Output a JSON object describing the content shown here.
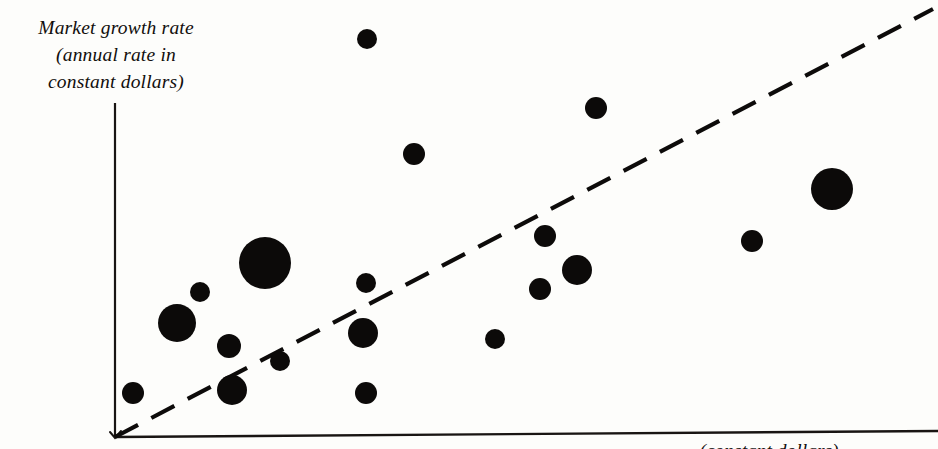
{
  "figure": {
    "title": "",
    "background_color": "#fdfdfb",
    "ink_color": "#0c0a09"
  },
  "axes": {
    "y_label": "Market growth rate\n(annual rate in\nconstant dollars)",
    "x_label": "(constant dollars)",
    "origin": {
      "x": 115,
      "y": 437
    },
    "y_axis_top": {
      "x": 115,
      "y": 103
    },
    "x_axis_right": {
      "x": 938,
      "y": 437
    },
    "has_ticks": false,
    "has_gridlines": false
  },
  "trend_line": {
    "style": "dashed",
    "start": {
      "x": 115,
      "y": 437
    },
    "end": {
      "x": 933,
      "y": 9
    },
    "dash_pattern": "26 15",
    "width": 4.2
  },
  "chart_data": {
    "type": "scatter",
    "title": "",
    "subtitle": "",
    "xlabel": "(constant dollars)",
    "ylabel": "Market growth rate (annual rate in constant dollars)",
    "legend": [],
    "legend_position": "none",
    "grid": false,
    "axis_ticks": false,
    "xlim": [
      115,
      938
    ],
    "ylim": [
      437,
      103
    ],
    "marker": "filled-circle",
    "marker_color": "#0c0a09",
    "size_encoding": "bubble radius in pixels (relative business size)",
    "note": "Bubble positions and radii are read directly off the printed figure in pixel coordinates; no numeric axis scale is printed on the chart.",
    "points": [
      {
        "id": 1,
        "x": 367,
        "y": 39,
        "r": 10
      },
      {
        "id": 2,
        "x": 596,
        "y": 108,
        "r": 11
      },
      {
        "id": 3,
        "x": 414,
        "y": 154,
        "r": 11
      },
      {
        "id": 4,
        "x": 832,
        "y": 189,
        "r": 21
      },
      {
        "id": 5,
        "x": 545,
        "y": 236,
        "r": 11
      },
      {
        "id": 6,
        "x": 752,
        "y": 241,
        "r": 11
      },
      {
        "id": 7,
        "x": 265,
        "y": 263,
        "r": 26
      },
      {
        "id": 8,
        "x": 577,
        "y": 270,
        "r": 15
      },
      {
        "id": 9,
        "x": 366,
        "y": 283,
        "r": 10
      },
      {
        "id": 10,
        "x": 540,
        "y": 289,
        "r": 11
      },
      {
        "id": 11,
        "x": 200,
        "y": 292,
        "r": 10
      },
      {
        "id": 12,
        "x": 177,
        "y": 323,
        "r": 19
      },
      {
        "id": 13,
        "x": 363,
        "y": 333,
        "r": 15
      },
      {
        "id": 14,
        "x": 495,
        "y": 339,
        "r": 10
      },
      {
        "id": 15,
        "x": 229,
        "y": 346,
        "r": 12
      },
      {
        "id": 16,
        "x": 280,
        "y": 361,
        "r": 10
      },
      {
        "id": 17,
        "x": 232,
        "y": 390,
        "r": 15
      },
      {
        "id": 18,
        "x": 366,
        "y": 393,
        "r": 11
      },
      {
        "id": 19,
        "x": 133,
        "y": 393,
        "r": 11
      }
    ]
  }
}
